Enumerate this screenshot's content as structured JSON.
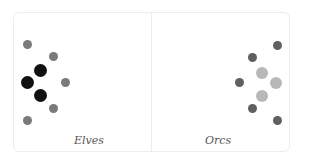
{
  "panels": [
    {
      "label": "Elves",
      "dots": [
        {
          "x": 27,
          "y": 44,
          "r": 4.5,
          "color": "#7a7a7a"
        },
        {
          "x": 53,
          "y": 56,
          "r": 4.5,
          "color": "#7a7a7a"
        },
        {
          "x": 40,
          "y": 70,
          "r": 6.5,
          "color": "#111111"
        },
        {
          "x": 27,
          "y": 82,
          "r": 6.5,
          "color": "#111111"
        },
        {
          "x": 65,
          "y": 82,
          "r": 4.5,
          "color": "#7a7a7a"
        },
        {
          "x": 40,
          "y": 95,
          "r": 6.5,
          "color": "#111111"
        },
        {
          "x": 53,
          "y": 108,
          "r": 4.5,
          "color": "#7a7a7a"
        },
        {
          "x": 27,
          "y": 120,
          "r": 4.5,
          "color": "#7a7a7a"
        }
      ]
    },
    {
      "label": "Orcs",
      "dots": [
        {
          "x": 277,
          "y": 45,
          "r": 4.5,
          "color": "#606060"
        },
        {
          "x": 252,
          "y": 57,
          "r": 4.5,
          "color": "#606060"
        },
        {
          "x": 262,
          "y": 73,
          "r": 6,
          "color": "#b8b8b8"
        },
        {
          "x": 239,
          "y": 82,
          "r": 4.5,
          "color": "#606060"
        },
        {
          "x": 276,
          "y": 83,
          "r": 6,
          "color": "#b8b8b8"
        },
        {
          "x": 262,
          "y": 96,
          "r": 6,
          "color": "#b8b8b8"
        },
        {
          "x": 252,
          "y": 108,
          "r": 4.5,
          "color": "#606060"
        },
        {
          "x": 277,
          "y": 120,
          "r": 4.5,
          "color": "#606060"
        }
      ]
    }
  ]
}
